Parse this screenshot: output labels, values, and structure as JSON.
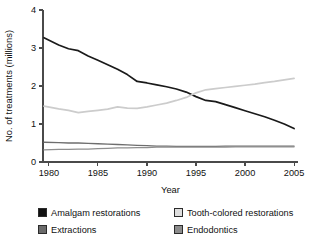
{
  "chart_data": {
    "type": "line",
    "title": "",
    "xlabel": "Year",
    "ylabel": "No. of treatments (millions)",
    "xlim": [
      1979.4,
      2005.4
    ],
    "ylim": [
      0,
      4
    ],
    "xticks": [
      1980,
      1985,
      1990,
      1995,
      2000,
      2005
    ],
    "xtick_labels": [
      "1980",
      "1985",
      "1990",
      "1995",
      "2000",
      "2005"
    ],
    "yticks": [
      0,
      1,
      2,
      3,
      4
    ],
    "ytick_labels": [
      "0",
      "1",
      "2",
      "3",
      "4"
    ],
    "grid": false,
    "legend_position": "below",
    "x": [
      1979.5,
      1981,
      1982,
      1983,
      1984,
      1985,
      1986,
      1987,
      1988,
      1989,
      1990,
      1991,
      1992,
      1993,
      1994,
      1995,
      1996,
      1997,
      1998,
      1999,
      2000,
      2001,
      2002,
      2003,
      2004,
      2005
    ],
    "series": [
      {
        "name": "Amalgam restorations",
        "color": "#1a1a1a",
        "values": [
          3.27,
          3.08,
          2.98,
          2.93,
          2.79,
          2.68,
          2.56,
          2.44,
          2.3,
          2.12,
          2.08,
          2.03,
          1.98,
          1.92,
          1.84,
          1.72,
          1.62,
          1.59,
          1.51,
          1.43,
          1.35,
          1.27,
          1.19,
          1.1,
          1.0,
          0.88
        ]
      },
      {
        "name": "Tooth-colored restorations",
        "color": "#cccccc",
        "values": [
          1.47,
          1.4,
          1.36,
          1.3,
          1.33,
          1.36,
          1.39,
          1.45,
          1.42,
          1.41,
          1.45,
          1.5,
          1.55,
          1.62,
          1.7,
          1.82,
          1.9,
          1.93,
          1.96,
          1.99,
          2.02,
          2.05,
          2.09,
          2.12,
          2.16,
          2.2
        ]
      },
      {
        "name": "Extractions",
        "color": "#6e6e6e",
        "values": [
          0.52,
          0.51,
          0.5,
          0.5,
          0.49,
          0.48,
          0.47,
          0.46,
          0.45,
          0.44,
          0.43,
          0.42,
          0.42,
          0.41,
          0.41,
          0.41,
          0.41,
          0.41,
          0.42,
          0.42,
          0.42,
          0.42,
          0.42,
          0.42,
          0.42,
          0.42
        ]
      },
      {
        "name": "Endodontics",
        "color": "#8f8f8f",
        "values": [
          0.32,
          0.33,
          0.33,
          0.34,
          0.34,
          0.35,
          0.36,
          0.37,
          0.37,
          0.38,
          0.38,
          0.39,
          0.39,
          0.39,
          0.39,
          0.39,
          0.39,
          0.39,
          0.39,
          0.4,
          0.4,
          0.4,
          0.4,
          0.4,
          0.4,
          0.4
        ]
      }
    ]
  },
  "legend": {
    "items": [
      {
        "label": "Amalgam restorations",
        "color": "#111111"
      },
      {
        "label": "Tooth-colored restorations",
        "color": "#dedede"
      },
      {
        "label": "Extractions",
        "color": "#6b6b6b"
      },
      {
        "label": "Endodontics",
        "color": "#8c8c8c"
      }
    ]
  }
}
